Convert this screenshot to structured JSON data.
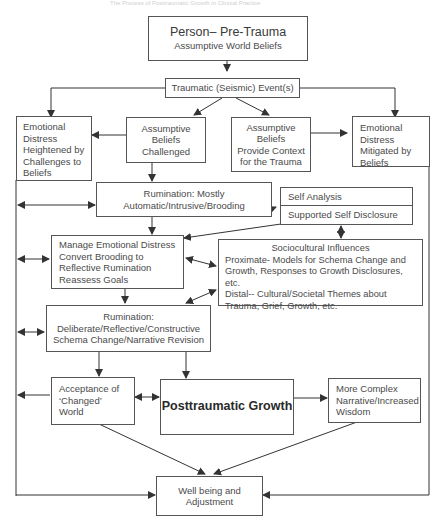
{
  "header": {
    "running_title": "The Process of Posttraumatic Growth in Clinical Practice"
  },
  "nodes": {
    "pre_trauma": {
      "title": "Person– Pre-Trauma",
      "subtitle": "Assumptive World Beliefs"
    },
    "traumatic_event": {
      "label": "Traumatic (Seismic) Event(s)"
    },
    "distress_heightened": {
      "lines": [
        "Emotional",
        "Distress",
        "Heightened by",
        "Challenges to",
        "Beliefs"
      ]
    },
    "beliefs_challenged": {
      "lines": [
        "Assumptive",
        "Beliefs",
        "Challenged"
      ]
    },
    "beliefs_context": {
      "lines": [
        "Assumptive",
        "Beliefs",
        "Provide Context",
        "for the Trauma"
      ]
    },
    "distress_mitigated": {
      "lines": [
        "Emotional",
        "Distress",
        "Mitigated by",
        "Beliefs"
      ]
    },
    "rumination_automatic": {
      "lines": [
        "Rumination: Mostly",
        "Automatic/Intrusive/Brooding"
      ]
    },
    "self_analysis": {
      "label": "Self Analysis"
    },
    "supported_disclosure": {
      "label": "Supported Self Disclosure"
    },
    "manage_distress": {
      "lines": [
        "Manage Emotional Distress",
        "Convert Brooding to",
        "Reflective Rumination",
        "Reassess Goals"
      ]
    },
    "sociocultural": {
      "lines": [
        "Sociocultural Influences",
        "Proximate- Models for Schema Change and",
        "Growth, Responses to Growth Disclosures, etc.",
        "Distal-- Cultural/Societal Themes about",
        "Trauma, Grief, Growth, etc."
      ]
    },
    "rumination_deliberate": {
      "lines": [
        "Rumination:",
        "Deliberate/Reflective/Constructive",
        "Schema Change/Narrative Revision"
      ]
    },
    "acceptance": {
      "lines": [
        "Acceptance of",
        "‘Changed’",
        "World"
      ]
    },
    "ptg": {
      "label": "Posttraumatic Growth"
    },
    "complex_narrative": {
      "lines": [
        "More Complex",
        "Narrative/Increased",
        "Wisdom"
      ]
    },
    "wellbeing": {
      "lines": [
        "Well being and",
        "Adjustment"
      ]
    }
  },
  "colors": {
    "line": "#333333",
    "box_border": "#555555",
    "text": "#4a4a4a"
  }
}
